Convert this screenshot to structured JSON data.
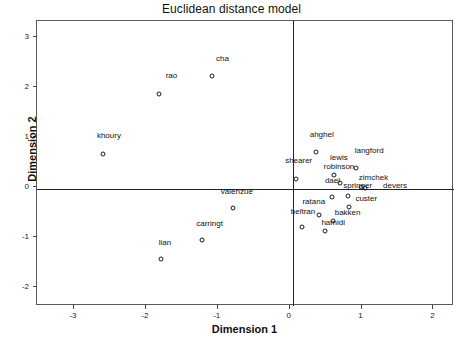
{
  "chart_data": {
    "type": "scatter",
    "title": "Euclidean distance model",
    "xlabel": "Dimension 1",
    "ylabel": "Dimension 2",
    "xlim": [
      -3.5,
      2.3
    ],
    "ylim": [
      -2.4,
      3.3
    ],
    "xticks": [
      -3,
      -2,
      -1,
      0,
      1,
      2
    ],
    "xticklabels": [
      "-3",
      "-2",
      "-1",
      "0",
      "1",
      "2"
    ],
    "yticks": [
      -2,
      -1,
      0,
      1,
      2,
      3
    ],
    "yticklabels": [
      "-2",
      "-1",
      "0",
      "1",
      "2",
      "3"
    ],
    "grid": false,
    "legend": "none",
    "zero_lines": true,
    "marker": "open-circle",
    "points": [
      {
        "label": "cha",
        "x": -1.07,
        "y": 2.2,
        "lx": -0.92,
        "ly": 2.46
      },
      {
        "label": "rao",
        "x": -1.8,
        "y": 1.85,
        "lx": -1.63,
        "ly": 2.12
      },
      {
        "label": "khoury",
        "x": -2.58,
        "y": 0.65,
        "lx": -2.5,
        "ly": 0.92
      },
      {
        "label": "ahghel",
        "x": 0.38,
        "y": 0.68,
        "lx": 0.46,
        "ly": 0.95
      },
      {
        "label": "langford",
        "x": 0.93,
        "y": 0.37,
        "lx": 1.12,
        "ly": 0.62
      },
      {
        "label": "lewis",
        "x": 0.63,
        "y": 0.22,
        "lx": 0.7,
        "ly": 0.48
      },
      {
        "label": "shearer",
        "x": 0.1,
        "y": 0.15,
        "lx": 0.14,
        "ly": 0.42
      },
      {
        "label": "robinson",
        "x": 0.72,
        "y": 0.07,
        "lx": 0.7,
        "ly": 0.3
      },
      {
        "label": "zimchek",
        "x": 1.0,
        "y": -0.02,
        "lx": 1.18,
        "ly": 0.08
      },
      {
        "label": "dael",
        "x": 0.6,
        "y": -0.22,
        "lx": 0.61,
        "ly": 0.02
      },
      {
        "label": "springer",
        "x": 0.82,
        "y": -0.2,
        "lx": 0.96,
        "ly": -0.08
      },
      {
        "label": "devers",
        "x": 1.06,
        "y": -0.04,
        "lx": 1.48,
        "ly": -0.08
      },
      {
        "label": "custer",
        "x": 0.84,
        "y": -0.42,
        "lx": 1.08,
        "ly": -0.34
      },
      {
        "label": "valenzue",
        "x": -0.78,
        "y": -0.44,
        "lx": -0.72,
        "ly": -0.2
      },
      {
        "label": "ratana",
        "x": 0.42,
        "y": -0.58,
        "lx": 0.35,
        "ly": -0.4
      },
      {
        "label": "bakken",
        "x": 0.62,
        "y": -0.7,
        "lx": 0.82,
        "ly": -0.62
      },
      {
        "label": "beltran",
        "x": 0.18,
        "y": -0.82,
        "lx": 0.2,
        "ly": -0.6
      },
      {
        "label": "hamidi",
        "x": 0.5,
        "y": -0.9,
        "lx": 0.62,
        "ly": -0.82
      },
      {
        "label": "carringt",
        "x": -1.2,
        "y": -1.08,
        "lx": -1.1,
        "ly": -0.84
      },
      {
        "label": "lian",
        "x": -1.78,
        "y": -1.46,
        "lx": -1.72,
        "ly": -1.22
      }
    ]
  }
}
